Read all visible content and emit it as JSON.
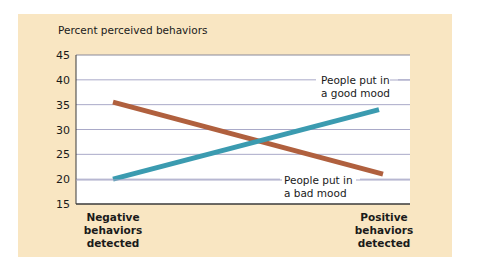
{
  "chart_data": {
    "type": "line",
    "title": "Percent perceived behaviors",
    "xlabel": "",
    "ylabel": "Percent perceived behaviors",
    "categories": [
      "Negative behaviors detected",
      "Positive behaviors detected"
    ],
    "ylim": [
      15,
      45
    ],
    "yticks": [
      15,
      20,
      25,
      30,
      35,
      40,
      45
    ],
    "grid": true,
    "series": [
      {
        "name": "People put in a good mood",
        "values": [
          20,
          34
        ],
        "color": "#3b9bb0"
      },
      {
        "name": "People put in a bad mood",
        "values": [
          35.5,
          21
        ],
        "color": "#b0603e"
      }
    ],
    "annotations": [
      {
        "text_line1": "People put in",
        "text_line2": "a good mood",
        "series": "good"
      },
      {
        "text_line1": "People put in",
        "text_line2": "a bad mood",
        "series": "bad"
      }
    ]
  },
  "labels": {
    "title": "Percent perceived behaviors",
    "cat_neg": [
      "Negative",
      "behaviors",
      "detected"
    ],
    "cat_pos": [
      "Positive",
      "behaviors",
      "detected"
    ],
    "good1": "People put in",
    "good2": "a good mood",
    "bad1": "People put in",
    "bad2": "a bad mood"
  },
  "colors": {
    "panel": "#f9e6c2",
    "good": "#3b9bb0",
    "bad": "#b0603e",
    "grid": "#a9a9c8"
  }
}
